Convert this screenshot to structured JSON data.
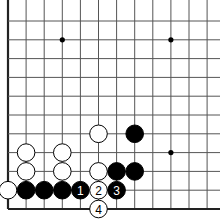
{
  "diagram": {
    "type": "go-board-fragment",
    "visible_edges": [
      "left",
      "bottom"
    ],
    "grid": {
      "cols": 12,
      "rows": 11,
      "origin_x": 8,
      "origin_y": 21,
      "dx": 18.1,
      "dy": 18.8
    },
    "star_points": [
      {
        "col": 3,
        "row": 1
      },
      {
        "col": 9,
        "row": 1
      },
      {
        "col": 9,
        "row": 7
      }
    ],
    "stones": [
      {
        "color": "white",
        "col": 0,
        "row": 9,
        "label": ""
      },
      {
        "color": "black",
        "col": 1,
        "row": 9,
        "label": ""
      },
      {
        "color": "black",
        "col": 2,
        "row": 9,
        "label": ""
      },
      {
        "color": "black",
        "col": 3,
        "row": 9,
        "label": ""
      },
      {
        "color": "black",
        "col": 4,
        "row": 9,
        "label": "1"
      },
      {
        "color": "white",
        "col": 5,
        "row": 9,
        "label": "2"
      },
      {
        "color": "black",
        "col": 6,
        "row": 9,
        "label": "3"
      },
      {
        "color": "white",
        "col": 5,
        "row": 10,
        "label": "4"
      },
      {
        "color": "white",
        "col": 1,
        "row": 8,
        "label": ""
      },
      {
        "color": "white",
        "col": 3,
        "row": 8,
        "label": ""
      },
      {
        "color": "white",
        "col": 5,
        "row": 8,
        "label": ""
      },
      {
        "color": "black",
        "col": 6,
        "row": 8,
        "label": ""
      },
      {
        "color": "black",
        "col": 7,
        "row": 8,
        "label": ""
      },
      {
        "color": "white",
        "col": 1,
        "row": 7,
        "label": ""
      },
      {
        "color": "white",
        "col": 3,
        "row": 7,
        "label": ""
      },
      {
        "color": "white",
        "col": 5,
        "row": 6,
        "label": ""
      },
      {
        "color": "black",
        "col": 7,
        "row": 6,
        "label": ""
      }
    ],
    "colors": {
      "black": "#000000",
      "white": "#ffffff",
      "line": "#555555",
      "edge": "#222222"
    }
  }
}
